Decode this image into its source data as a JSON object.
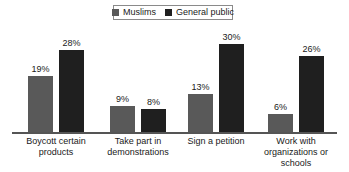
{
  "chart_data": {
    "type": "bar",
    "title": "",
    "subtitle": "",
    "xlabel": "",
    "ylabel": "",
    "ylim": [
      0,
      32
    ],
    "grid": false,
    "legend_position": "top-center",
    "value_suffix": "%",
    "categories": [
      "Boycott certain products",
      "Take part in demonstrations",
      "Sign a petition",
      "Work with organizations or schools"
    ],
    "series": [
      {
        "name": "Muslims",
        "color": "#595959",
        "values": [
          19,
          9,
          13,
          6
        ],
        "labels": [
          "19%",
          "9%",
          "13%",
          "6%"
        ]
      },
      {
        "name": "General public",
        "color": "#1f1f1f",
        "values": [
          28,
          8,
          30,
          26
        ],
        "labels": [
          "28%",
          "8%",
          "30%",
          "26%"
        ]
      }
    ]
  },
  "legend": {
    "entries": [
      {
        "label": "Muslims",
        "swatch": "#595959"
      },
      {
        "label": "General public",
        "swatch": "#1f1f1f"
      }
    ]
  },
  "axis": {
    "baseline_color": "#555555"
  },
  "category_lines": [
    [
      "Boycott certain",
      "products"
    ],
    [
      "Take part in",
      "demonstrations"
    ],
    [
      "Sign a petition"
    ],
    [
      "Work with",
      "organizations or",
      "schools"
    ]
  ]
}
